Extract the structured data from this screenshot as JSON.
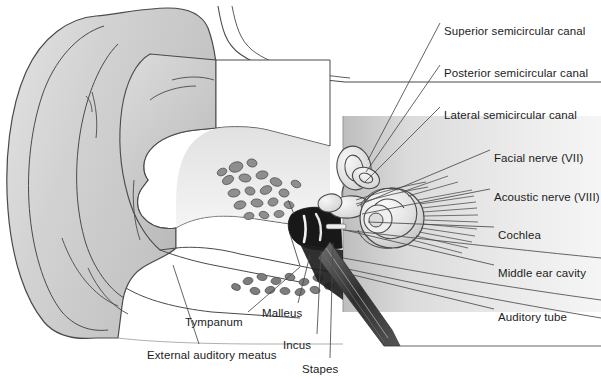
{
  "figure": {
    "background_color": "#ffffff",
    "line_color": "#4a4a4a",
    "text_color": "#1c1c1c",
    "pinna_fill": "#d6d6d6",
    "canal_fill": "#ffffff",
    "panel_fill": "#d9d9d9",
    "ossicle_fill": "#181818",
    "cochlea_fill": "#e8e8e8"
  },
  "labels": [
    {
      "id": "superior-semicircular-canal",
      "text": "Superior semicircular canal",
      "x": 444,
      "y": 25,
      "anchor": "left"
    },
    {
      "id": "posterior-semicircular-canal",
      "text": "Posterior semicircular canal",
      "x": 444,
      "y": 67,
      "anchor": "left"
    },
    {
      "id": "lateral-semicircular-canal",
      "text": "Lateral semicircular canal",
      "x": 444,
      "y": 109,
      "anchor": "left"
    },
    {
      "id": "facial-nerve",
      "text": "Facial nerve (VII)",
      "x": 494,
      "y": 152,
      "anchor": "left"
    },
    {
      "id": "acoustic-nerve",
      "text": "Acoustic nerve (VIII)",
      "x": 494,
      "y": 191,
      "anchor": "left"
    },
    {
      "id": "cochlea",
      "text": "Cochlea",
      "x": 498,
      "y": 229,
      "anchor": "left"
    },
    {
      "id": "middle-ear-cavity",
      "text": "Middle ear cavity",
      "x": 498,
      "y": 267,
      "anchor": "left"
    },
    {
      "id": "auditory-tube",
      "text": "Auditory tube",
      "x": 498,
      "y": 311,
      "anchor": "left"
    },
    {
      "id": "tympanum",
      "text": "Tympanum",
      "x": 185,
      "y": 316,
      "anchor": "left"
    },
    {
      "id": "malleus",
      "text": "Malleus",
      "x": 262,
      "y": 307,
      "anchor": "left"
    },
    {
      "id": "incus",
      "text": "Incus",
      "x": 283,
      "y": 339,
      "anchor": "left"
    },
    {
      "id": "stapes",
      "text": "Stapes",
      "x": 302,
      "y": 363,
      "anchor": "left"
    },
    {
      "id": "external-auditory-meatus",
      "text": "External auditory meatus",
      "x": 147,
      "y": 349,
      "anchor": "left"
    }
  ],
  "leader_lines": [
    {
      "id": "leader-superior-semicircular-canal",
      "points": "440,23 368,160"
    },
    {
      "id": "leader-posterior-semicircular-canal",
      "points": "440,65 366,172"
    },
    {
      "id": "leader-lateral-semicircular-canal",
      "points": "440,107 365,182"
    },
    {
      "id": "leader-facial-nerve",
      "points": "490,150 357,206"
    },
    {
      "id": "leader-acoustic-nerve",
      "points": "490,189 362,214"
    },
    {
      "id": "leader-cochlea",
      "points": "494,227 368,222"
    },
    {
      "id": "leader-middle-ear-cavity",
      "points": "494,265 345,230"
    },
    {
      "id": "leader-auditory-tube",
      "points": "494,309 345,273"
    },
    {
      "id": "leader-tympanum",
      "points": "248,312 300,267"
    },
    {
      "id": "leader-malleus",
      "points": "298,303 310,255"
    },
    {
      "id": "leader-incus",
      "points": "317,334 321,252"
    },
    {
      "id": "leader-stapes",
      "points": "330,358 333,243"
    },
    {
      "id": "leader-external-auditory-meatus",
      "points": "199,344 173,265"
    }
  ],
  "structures": [
    {
      "id": "pinna",
      "name": "auricle-pinna"
    },
    {
      "id": "ear-canal",
      "name": "external-auditory-meatus"
    },
    {
      "id": "mastoid-cells",
      "name": "mastoid-air-cells"
    },
    {
      "id": "tympanic-membrane",
      "name": "tympanum"
    },
    {
      "id": "ossicles",
      "name": "malleus-incus-stapes"
    },
    {
      "id": "semicircular-canals",
      "name": "semicircular-canals"
    },
    {
      "id": "cochlea-spiral",
      "name": "cochlea"
    },
    {
      "id": "nerve-bundle",
      "name": "acoustic-nerve-fibers"
    },
    {
      "id": "eustachian-tube",
      "name": "auditory-tube"
    }
  ]
}
